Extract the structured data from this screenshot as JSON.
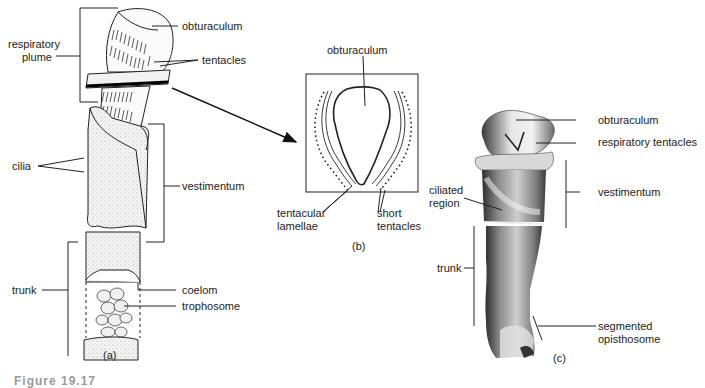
{
  "figure": {
    "caption": "Figure 19.17",
    "panels": {
      "a": {
        "tag": "(a)",
        "labels": {
          "respiratory_plume_1": "respiratory",
          "respiratory_plume_2": "plume",
          "obturaculum": "obturaculum",
          "tentacles": "tentacles",
          "cilia": "cilia",
          "vestimentum": "vestimentum",
          "trunk": "trunk",
          "coelom": "coelom",
          "trophosome": "trophosome"
        }
      },
      "b": {
        "tag": "(b)",
        "labels": {
          "obturaculum": "obturaculum",
          "tentacular_lamellae_1": "tentacular",
          "tentacular_lamellae_2": "lamellae",
          "short_tentacles_1": "short",
          "short_tentacles_2": "tentacles"
        }
      },
      "c": {
        "tag": "(c)",
        "labels": {
          "obturaculum": "obturaculum",
          "respiratory_tentacles": "respiratory tentacles",
          "ciliated_region_1": "ciliated",
          "ciliated_region_2": "region",
          "vestimentum": "vestimentum",
          "trunk": "trunk",
          "segmented_opisthosome_1": "segmented",
          "segmented_opisthosome_2": "opisthosome"
        }
      }
    }
  }
}
